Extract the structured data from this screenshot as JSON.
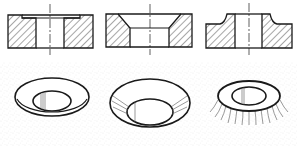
{
  "diagram": {
    "title": "",
    "colors": {
      "background": "#ffffff",
      "line": "#1a1a1a",
      "hatch": "#3a3a3a",
      "stipple": "#c8c8c8"
    },
    "panels": [
      {
        "id": "counterbore",
        "view_section": "stepped recess at top of hole",
        "view_pictorial": "flat ring around hole"
      },
      {
        "id": "countersink",
        "view_section": "conical taper at top of hole",
        "view_pictorial": "conical bowl"
      },
      {
        "id": "spotface-boss",
        "view_section": "raised boss with filleted edge",
        "view_pictorial": "raised ring with radial shading"
      }
    ],
    "labels": []
  }
}
